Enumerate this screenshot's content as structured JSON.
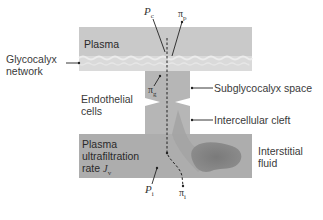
{
  "diagram": {
    "regions": {
      "plasma": "Plasma",
      "endothelial_cells": "Endothelial\ncells",
      "plasma_ultrafiltration": [
        "Plasma",
        "ultrafiltration",
        "rate"
      ],
      "jv_symbol": "J",
      "jv_sub": "v"
    },
    "callouts": {
      "glycocalyx": [
        "Glycocalyx",
        "network"
      ],
      "subglycocalyx": "Subglycocalyx space",
      "intercellular": "Intercellular cleft",
      "interstitial": [
        "Interstitial",
        "fluid"
      ]
    },
    "symbols": {
      "pc": {
        "base": "P",
        "sub": "c"
      },
      "pi_p": {
        "base": "π",
        "sub": "p"
      },
      "pi_g": {
        "base": "π",
        "sub": "g"
      },
      "pi_i": {
        "base": "π",
        "sub": "i"
      },
      "pi_cap": {
        "base": "P",
        "sub": "i"
      }
    },
    "colors": {
      "plasma": "#c6c6c6",
      "glycocalyx": "#dcdcdc",
      "cell_channel": "#b3b3b3",
      "interstitial": "#ababab",
      "fluid_blob": "#7e7e7e"
    }
  }
}
